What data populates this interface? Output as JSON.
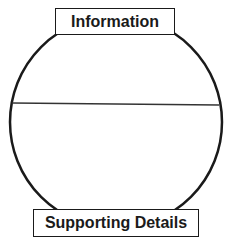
{
  "diagram": {
    "type": "divided-circle-organizer",
    "top_label": "Information",
    "bottom_label": "Supporting Details",
    "colors": {
      "stroke": "#1a1a1a",
      "background": "#ffffff"
    }
  }
}
